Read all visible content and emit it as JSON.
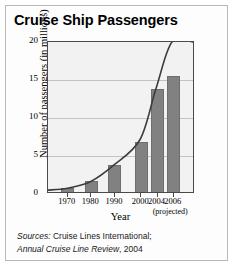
{
  "figure": {
    "title": "Cruise Ship Passengers",
    "sources_label": "Sources:",
    "sources_line1_rest": " Cruise Lines International;",
    "sources_line2_italic": "Annual Cruise Line Review",
    "sources_line2_rest": ", 2004"
  },
  "chart_data": {
    "type": "bar",
    "title": "Cruise Ship Passengers",
    "xlabel": "Year",
    "ylabel": "Number of passengers (in millions)",
    "categories": [
      "1970",
      "1980",
      "1990",
      "2000",
      "2004",
      "2006"
    ],
    "values": [
      0.5,
      1.4,
      3.6,
      6.6,
      13.5,
      15.2
    ],
    "annotations": [
      "(projected)"
    ],
    "projected_category": "2006",
    "ylim": [
      0,
      20
    ],
    "yticks": [
      0,
      5,
      10,
      15,
      20
    ],
    "yticklabels": [
      "0",
      "5",
      "10",
      "15",
      "20"
    ],
    "yminorticks": [
      2.5,
      7.5,
      12.5,
      17.5
    ],
    "grid": true,
    "legend": "none",
    "overlay_series": {
      "name": "trend-curve",
      "type": "line",
      "x": [
        1970,
        1980,
        1990,
        2000,
        2004,
        2006
      ],
      "y": [
        0.5,
        1.4,
        3.6,
        7.0,
        13.8,
        20.0
      ]
    },
    "bar_color": "#818181",
    "curve_color": "#3c3c3c",
    "plot_background": "#f2f2f2"
  },
  "ylabel_text": "Number of passengers (in millions)",
  "xlabel_text": "Year",
  "projected_note": "(projected)"
}
